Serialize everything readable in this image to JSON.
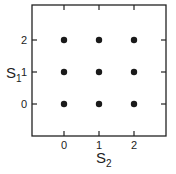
{
  "chart_data": {
    "type": "scatter",
    "title": "",
    "xlabel": "S2",
    "ylabel": "S1",
    "xlabel_main": "S",
    "xlabel_sub": "2",
    "ylabel_main": "S",
    "ylabel_sub": "1",
    "x_ticks": [
      "0",
      "1",
      "2"
    ],
    "y_ticks": [
      "0",
      "1",
      "2"
    ],
    "xlim": [
      -1,
      2.9
    ],
    "ylim": [
      -1,
      2.9
    ],
    "grid": false,
    "legend": null,
    "points": [
      {
        "x": 0,
        "y": 0
      },
      {
        "x": 1,
        "y": 0
      },
      {
        "x": 2,
        "y": 0
      },
      {
        "x": 0,
        "y": 1
      },
      {
        "x": 1,
        "y": 1
      },
      {
        "x": 2,
        "y": 1
      },
      {
        "x": 0,
        "y": 2
      },
      {
        "x": 1,
        "y": 2
      },
      {
        "x": 2,
        "y": 2
      }
    ],
    "colors": {
      "axis": "#222222",
      "point": "#1a1a1a"
    }
  }
}
